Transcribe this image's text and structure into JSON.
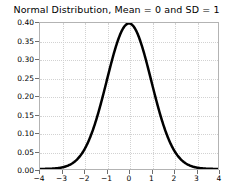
{
  "chart_data": {
    "type": "line",
    "title": "Normal Distribution, Mean = 0 and SD = 1",
    "xlabel": "",
    "ylabel": "",
    "xlim": [
      -4,
      4
    ],
    "ylim": [
      0.0,
      0.4
    ],
    "grid": true,
    "legend": null,
    "mean": 0,
    "sd": 1,
    "line_color": "#000000",
    "line_width": 2.5,
    "xticks": [
      -4,
      -3,
      -2,
      -1,
      0,
      1,
      2,
      3,
      4
    ],
    "xtick_labels": [
      "−4",
      "−3",
      "−2",
      "−1",
      "0",
      "1",
      "2",
      "3",
      "4"
    ],
    "yticks": [
      0.0,
      0.05,
      0.1,
      0.15,
      0.2,
      0.25,
      0.3,
      0.35,
      0.4
    ],
    "ytick_labels": [
      "0.00",
      "0.05",
      "0.10",
      "0.15",
      "0.20",
      "0.25",
      "0.30",
      "0.35",
      "0.40"
    ],
    "x": [
      -4.0,
      -3.8,
      -3.6,
      -3.4,
      -3.2,
      -3.0,
      -2.8,
      -2.6,
      -2.4,
      -2.2,
      -2.0,
      -1.8,
      -1.6,
      -1.4,
      -1.2,
      -1.0,
      -0.8,
      -0.6,
      -0.4,
      -0.2,
      0.0,
      0.2,
      0.4,
      0.6,
      0.8,
      1.0,
      1.2,
      1.4,
      1.6,
      1.8,
      2.0,
      2.2,
      2.4,
      2.6,
      2.8,
      3.0,
      3.2,
      3.4,
      3.6,
      3.8,
      4.0
    ],
    "y": [
      0.0001,
      0.0003,
      0.0006,
      0.0012,
      0.0024,
      0.0044,
      0.0079,
      0.0136,
      0.0224,
      0.0355,
      0.054,
      0.079,
      0.1109,
      0.1497,
      0.1942,
      0.242,
      0.2897,
      0.3332,
      0.3683,
      0.391,
      0.3989,
      0.391,
      0.3683,
      0.3332,
      0.2897,
      0.242,
      0.1942,
      0.1497,
      0.1109,
      0.079,
      0.054,
      0.0355,
      0.0224,
      0.0136,
      0.0079,
      0.0044,
      0.0024,
      0.0012,
      0.0006,
      0.0003,
      0.0001
    ],
    "peak_value": 0.3989,
    "peak_x": 0
  }
}
